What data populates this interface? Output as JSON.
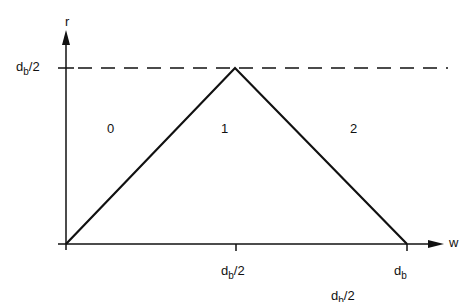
{
  "diagram": {
    "type": "piecewise-linear plot",
    "axes": {
      "y_label": "r",
      "x_label": "w"
    },
    "y_ticks": [
      {
        "base": "d",
        "sub": "b",
        "suffix": "/2"
      }
    ],
    "x_ticks": [
      {
        "base": "d",
        "sub": "b",
        "suffix": "/2"
      },
      {
        "base": "d",
        "sub": "b",
        "suffix": ""
      }
    ],
    "stray_label": {
      "base": "d",
      "sub": "b",
      "suffix": "/2"
    },
    "regions": [
      "0",
      "1",
      "2"
    ],
    "curve_points": [
      [
        0,
        0
      ],
      [
        0.5,
        0.5
      ],
      [
        1,
        0
      ]
    ],
    "reference_line": "dashed horizontal at r = d_b/2",
    "colors": {
      "ink": "#111111",
      "background": "#ffffff"
    }
  }
}
